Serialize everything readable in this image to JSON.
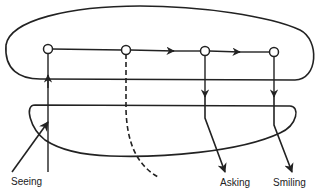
{
  "diagram": {
    "labels": {
      "seeing": "Seeing",
      "asking": "Asking",
      "smiling": "Smiling"
    },
    "nodes": [
      {
        "id": "n1",
        "x": 48,
        "y": 49
      },
      {
        "id": "n2",
        "x": 126,
        "y": 50
      },
      {
        "id": "n3",
        "x": 205,
        "y": 51
      },
      {
        "id": "n4",
        "x": 274,
        "y": 52
      }
    ],
    "colors": {
      "stroke": "#222222",
      "background": "#ffffff"
    }
  }
}
